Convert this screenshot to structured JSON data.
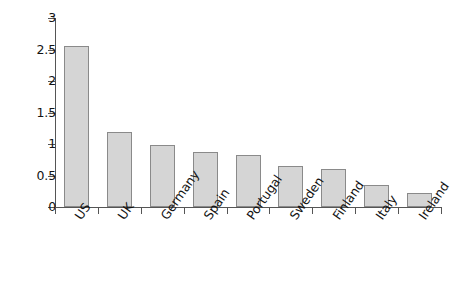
{
  "chart_data": {
    "type": "bar",
    "title": "",
    "subtitle": "",
    "xlabel": "",
    "ylabel": "",
    "categories": [
      "US",
      "UK",
      "Germany",
      "Spain",
      "Portugal",
      "Sweden",
      "Finland",
      "Italy",
      "Ireland"
    ],
    "values": [
      2.55,
      1.19,
      0.98,
      0.87,
      0.82,
      0.65,
      0.6,
      0.35,
      0.22
    ],
    "ylim": [
      0,
      3
    ],
    "ytick_labels": [
      "0",
      "0.5",
      "1",
      "1.5",
      "2",
      "2.5",
      "3"
    ],
    "ytick_values": [
      0,
      0.5,
      1,
      1.5,
      2,
      2.5,
      3
    ],
    "grid": false,
    "legend": null,
    "legend_position": "none",
    "annotations": [],
    "bar_fill_color": "#d5d5d5",
    "bar_border_color": "#8a8a8a",
    "axis_color": "#555555",
    "background_color": "#ffffff",
    "xtick_label_rotation": -55
  }
}
